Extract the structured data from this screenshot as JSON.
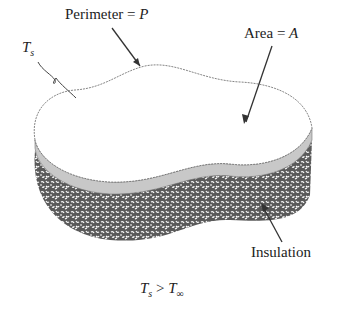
{
  "diagram": {
    "labels": {
      "perimeter": {
        "text": "Perimeter = ",
        "var": "P"
      },
      "area": {
        "text": "Area = ",
        "var": "A"
      },
      "surface_temp": {
        "var": "T",
        "sub": "s"
      },
      "insulation": "Insulation",
      "condition": {
        "lhs_var": "T",
        "lhs_sub": "s",
        "op": " > ",
        "rhs_var": "T",
        "rhs_sub": "∞"
      }
    },
    "colors": {
      "top_surface": "#ffffff",
      "outline": "#555555",
      "side_band": "#c8c8c8",
      "insulation_dark": "#555555",
      "insulation_light": "#ffffff",
      "arrow": "#333333"
    }
  }
}
